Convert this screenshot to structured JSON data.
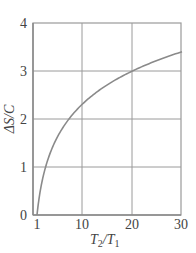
{
  "chart_data": {
    "type": "line",
    "title": "",
    "xlabel": "T2/T1",
    "ylabel": "ΔS/C",
    "xlim": [
      0.2,
      30
    ],
    "ylim": [
      0,
      4
    ],
    "xticks": [
      1,
      10,
      20,
      30
    ],
    "yticks": [
      0,
      1,
      2,
      3,
      4
    ],
    "grid": true,
    "series": [
      {
        "name": "ΔS/C = ln(T2/T1)",
        "x": [
          1,
          1.5,
          2,
          2.718,
          4,
          5,
          7.39,
          10,
          15,
          20,
          25,
          30
        ],
        "y": [
          0,
          0.41,
          0.69,
          1.0,
          1.39,
          1.61,
          2.0,
          2.3,
          2.71,
          3.0,
          3.22,
          3.4
        ]
      }
    ],
    "colors": {
      "curve": "#8a8a8a",
      "grid": "#9a9a9a",
      "axis": "#888888"
    }
  },
  "labels": {
    "y_ticks": [
      "0",
      "1",
      "2",
      "3",
      "4"
    ],
    "x_ticks": [
      "1",
      "10",
      "20",
      "30"
    ],
    "x_axis_main": "T",
    "x_axis_sub1": "2",
    "x_axis_slash": "/T",
    "x_axis_sub2": "1",
    "y_axis": "ΔS/C"
  }
}
